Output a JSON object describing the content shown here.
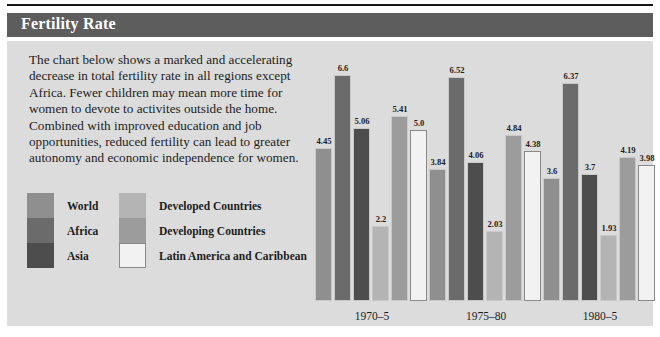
{
  "header": {
    "title": "Fertility Rate"
  },
  "body": {
    "paragraph": "The chart below shows a marked and accelerating decrease in total fertility rate in all regions except Africa. Fewer children may mean more time for women to devote to activites outside the home. Combined with improved education and job opportunities, reduced fertility can lead to greater autonomy and economic independence for women."
  },
  "colors": {
    "title_bar": "#5d5d5d",
    "panel_background": "#dcdcdc",
    "top_rule": "#151515",
    "text": "#1d1d1d",
    "series": [
      "#8f8f8f",
      "#6b6b6b",
      "#4d4d4d",
      "#b4b4b4",
      "#9c9c9c",
      "#f2f2f2"
    ]
  },
  "legend": {
    "column_left": [
      {
        "label": "World",
        "color": "#8f8f8f"
      },
      {
        "label": "Africa",
        "color": "#6b6b6b"
      },
      {
        "label": "Asia",
        "color": "#4d4d4d"
      }
    ],
    "column_right": [
      {
        "label": "Developed Countries",
        "color": "#b4b4b4"
      },
      {
        "label": "Developing Countries",
        "color": "#9c9c9c"
      },
      {
        "label": "Latin America and Caribbean",
        "color": "#f2f2f2"
      }
    ]
  },
  "chart_data": {
    "type": "bar",
    "title": "Fertility Rate",
    "xlabel": "",
    "ylabel": "",
    "ylim": [
      0,
      7
    ],
    "grid": false,
    "legend_position": "left",
    "categories": [
      "1970–5",
      "1975–80",
      "1980–5"
    ],
    "series": [
      {
        "name": "World",
        "color": "#8f8f8f",
        "values": [
          4.45,
          3.84,
          3.6
        ]
      },
      {
        "name": "Africa",
        "color": "#6b6b6b",
        "values": [
          6.6,
          6.52,
          6.37
        ]
      },
      {
        "name": "Asia",
        "color": "#4d4d4d",
        "values": [
          5.06,
          4.06,
          3.7
        ]
      },
      {
        "name": "Developed Countries",
        "color": "#b4b4b4",
        "values": [
          2.2,
          2.03,
          1.93
        ]
      },
      {
        "name": "Developing Countries",
        "color": "#9c9c9c",
        "values": [
          5.41,
          4.84,
          4.19
        ]
      },
      {
        "name": "Latin America and Caribbean",
        "color": "#f2f2f2",
        "values": [
          5.0,
          4.38,
          3.98
        ]
      }
    ],
    "value_labels": [
      [
        "4.45",
        "6.6",
        "5.06",
        "2.2",
        "5.41",
        "5.0"
      ],
      [
        "3.84",
        "6.52",
        "4.06",
        "2.03",
        "4.84",
        "4.38"
      ],
      [
        "3.6",
        "6.37",
        "3.7",
        "1.93",
        "4.19",
        "3.98"
      ]
    ]
  }
}
